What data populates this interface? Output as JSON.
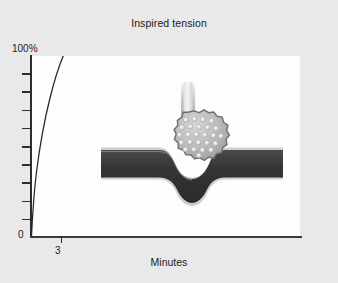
{
  "figure": {
    "background_color": "#e9e9e9",
    "plot_background_color": "#fdfdfd",
    "axis_color": "#2c2c2c",
    "curve_color": "#262626"
  },
  "chart_data": {
    "type": "line",
    "title": "Inspired tension",
    "subtitle": "",
    "xlabel": "Minutes",
    "ylabel": "",
    "xlim": [
      0,
      27
    ],
    "ylim": [
      0,
      100
    ],
    "grid": false,
    "legend": false,
    "x_tick_labels": [
      "3"
    ],
    "x_tick_values": [
      3
    ],
    "y_tick_labels": [
      "0",
      "100%"
    ],
    "y_tick_values": [
      0,
      100
    ],
    "y_minor_tick_count": 9,
    "series": [
      {
        "name": "Inspired tension",
        "x": [
          0.0,
          0.15,
          0.3,
          0.5,
          0.8,
          1.1,
          1.5,
          2.0,
          2.5,
          3.0,
          3.3
        ],
        "values": [
          0,
          14,
          27,
          42,
          58,
          68,
          78,
          87,
          94,
          99,
          100
        ]
      }
    ],
    "annotations": [
      {
        "name": "alveolus-capillary-illustration",
        "description": "Alveolus with airway tube opening into an indented capillary blood vessel"
      }
    ]
  },
  "illustration": {
    "airway_label": "airway-tube",
    "alveolus_label": "alveolus-sac",
    "capillary_label": "capillary-vessel",
    "alveolus_fill": "#b9b9b9",
    "alveolus_edge": "#6e6e6e",
    "capillary_fill": "#3a3a3a",
    "capillary_edge": "#c8c8c8",
    "bubble_fill": "#e2e2e2",
    "bubble_count": 25
  }
}
